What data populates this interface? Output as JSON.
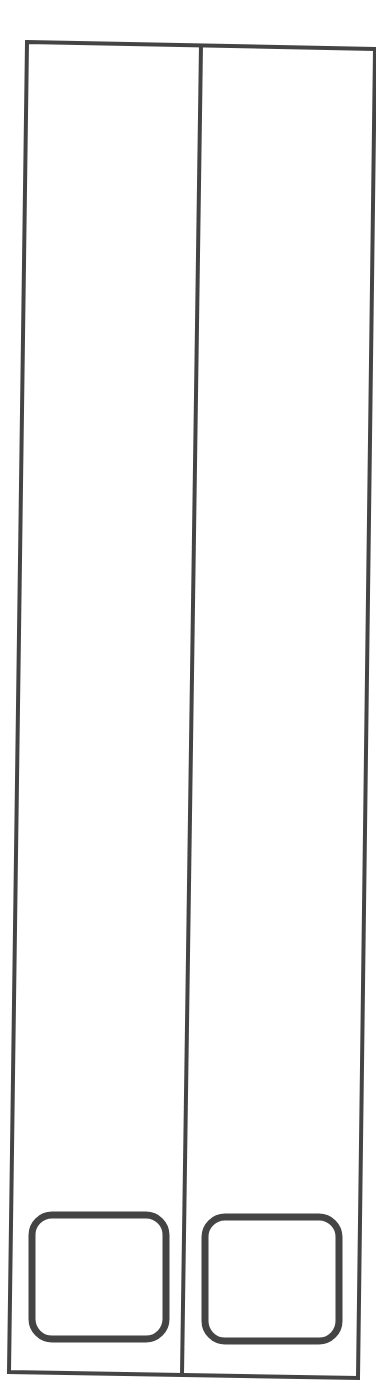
{
  "drawing": {
    "description": "Line drawing of a tall two-door cabinet with two rounded handles/drawers at the bottom",
    "stroke_color": "#444444",
    "background": "#ffffff",
    "outer_frame": {
      "points": [
        [
          27,
          42
        ],
        [
          375,
          49
        ],
        [
          358,
          1378
        ],
        [
          9,
          1372
        ]
      ]
    },
    "divider": {
      "x1": 201,
      "y1": 45,
      "x2": 182,
      "y2": 1375
    },
    "panels": [
      {
        "name": "left-rounded-square",
        "x": 32,
        "y": 1215,
        "width": 134,
        "height": 124,
        "rx": 20
      },
      {
        "name": "right-rounded-square",
        "x": 205,
        "y": 1217,
        "width": 134,
        "height": 124,
        "rx": 20
      }
    ]
  }
}
